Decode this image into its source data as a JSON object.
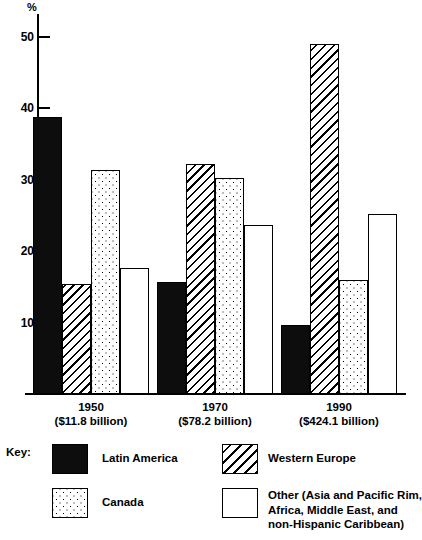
{
  "chart_data": {
    "type": "bar",
    "title": "",
    "xlabel": "",
    "ylabel": "%",
    "ylim": [
      0,
      52
    ],
    "yticks": [
      10,
      20,
      30,
      40,
      50
    ],
    "ytick_labels": [
      "10",
      "20",
      "30",
      "40",
      "50"
    ],
    "grid": false,
    "legend_position": "bottom",
    "categories": [
      "1950",
      "1970",
      "1990"
    ],
    "category_sublabels": [
      "($11.8 billion)",
      "($78.2 billion)",
      "($424.1 billion)"
    ],
    "series": [
      {
        "name": "Latin America",
        "pattern": "solid",
        "values": [
          38.8,
          15.7,
          9.7
        ]
      },
      {
        "name": "Western Europe",
        "pattern": "hatch",
        "values": [
          15.4,
          32.2,
          49.0
        ]
      },
      {
        "name": "Canada",
        "pattern": "dots",
        "values": [
          31.4,
          30.2,
          16.0
        ]
      },
      {
        "name": "Other (Asia and Pacific Rim, Africa, Middle East, and non-Hispanic Caribbean)",
        "pattern": "open",
        "values": [
          17.6,
          23.7,
          25.2
        ]
      }
    ]
  },
  "axis": {
    "unit_label": "%",
    "tick_50": "50",
    "tick_40": "40",
    "tick_30": "30",
    "tick_20": "20",
    "tick_10": "10"
  },
  "groups": [
    {
      "year": "1950",
      "amount": "($11.8 billion)"
    },
    {
      "year": "1970",
      "amount": "($78.2 billion)"
    },
    {
      "year": "1990",
      "amount": "($424.1 billion)"
    }
  ],
  "legend": {
    "title": "Key:",
    "items": [
      {
        "label": "Latin America",
        "pattern": "solid"
      },
      {
        "label": "Western Europe",
        "pattern": "hatch"
      },
      {
        "label": "Canada",
        "pattern": "dots"
      },
      {
        "label": "Other (Asia and Pacific Rim,\nAfrica, Middle East, and\nnon-Hispanic Caribbean)",
        "pattern": "open"
      }
    ]
  },
  "colors": {
    "ink": "#000000",
    "paper": "#ffffff",
    "solid_fill": "#0d0d0d"
  }
}
